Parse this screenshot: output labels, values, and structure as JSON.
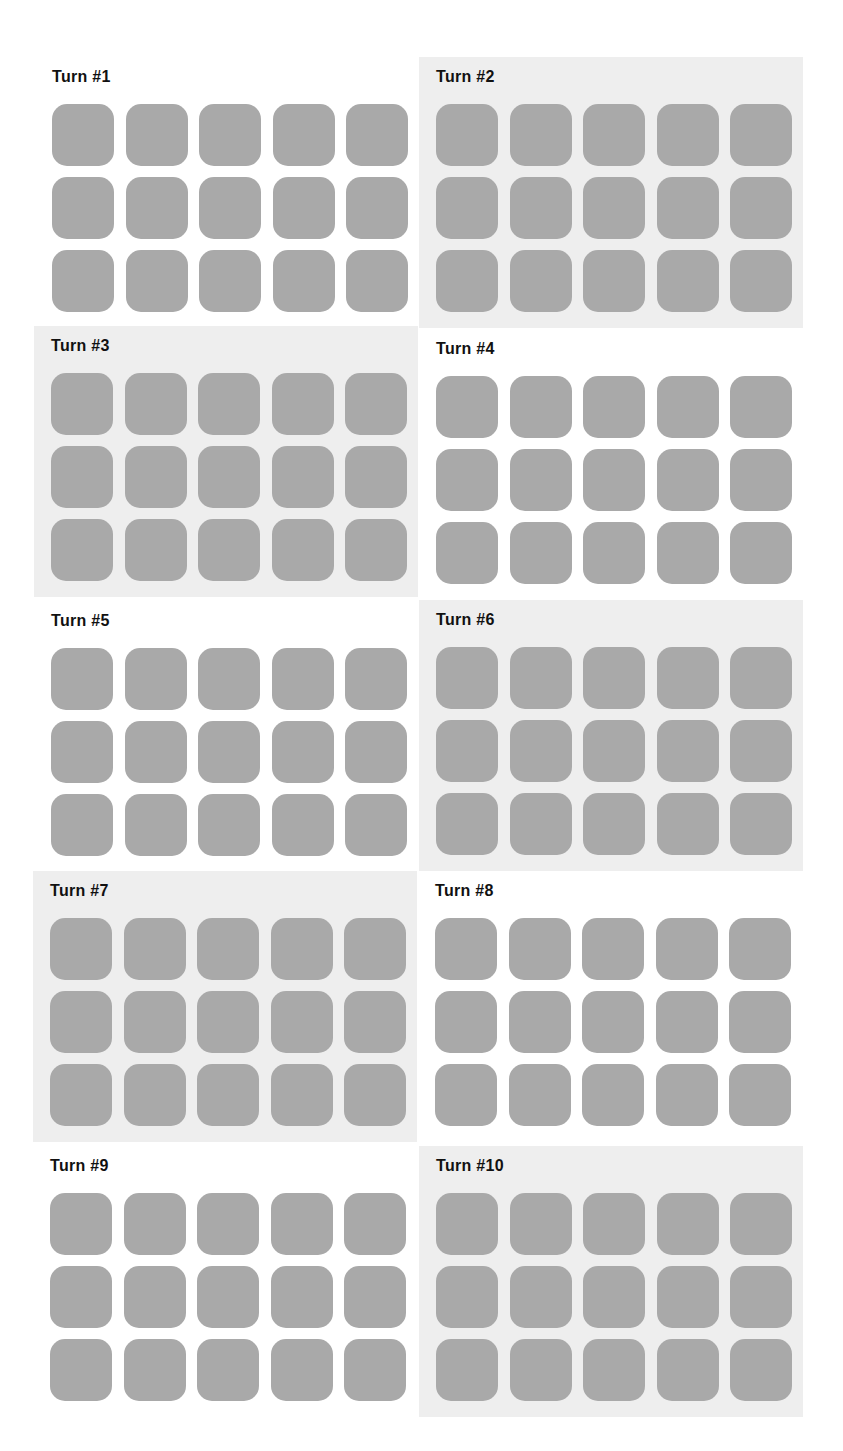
{
  "colors": {
    "page_background": "#ffffff",
    "shaded_panel_background": "#eeeeee",
    "tile": "#a9a9a9",
    "title_text": "#111111"
  },
  "grid": {
    "rows": 3,
    "columns": 5
  },
  "turns": [
    {
      "title": "Turn #1",
      "shaded": false,
      "tiles": 15
    },
    {
      "title": "Turn #2",
      "shaded": true,
      "tiles": 15
    },
    {
      "title": "Turn #3",
      "shaded": true,
      "tiles": 15
    },
    {
      "title": "Turn #4",
      "shaded": false,
      "tiles": 15
    },
    {
      "title": "Turn #5",
      "shaded": false,
      "tiles": 15
    },
    {
      "title": "Turn #6",
      "shaded": true,
      "tiles": 15
    },
    {
      "title": "Turn #7",
      "shaded": true,
      "tiles": 15
    },
    {
      "title": "Turn #8",
      "shaded": false,
      "tiles": 15
    },
    {
      "title": "Turn #9",
      "shaded": false,
      "tiles": 15
    },
    {
      "title": "Turn #10",
      "shaded": true,
      "tiles": 15
    }
  ]
}
